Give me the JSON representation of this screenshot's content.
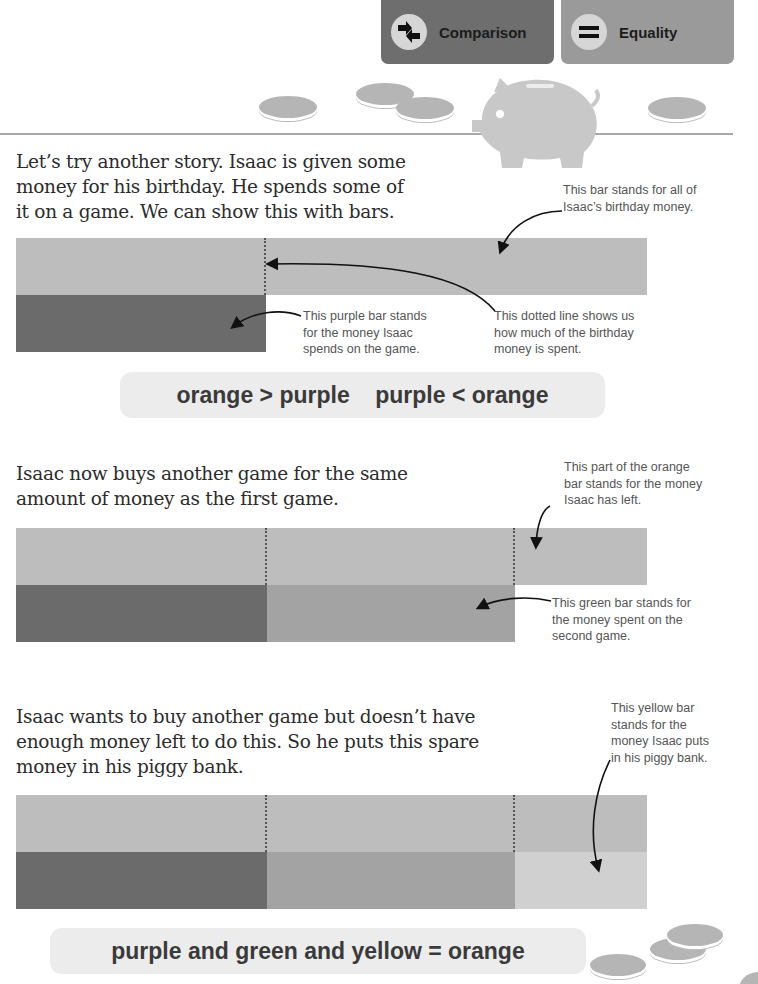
{
  "header": {
    "tabs": [
      {
        "label": "Comparison",
        "icon": "comparison-arrows-icon",
        "color": "#6e6e6e"
      },
      {
        "label": "Equality",
        "icon": "equals-icon",
        "color": "#9a9a9a"
      }
    ]
  },
  "colors": {
    "orange": "#bdbdbd",
    "purple": "#6b6b6b",
    "green": "#a3a3a3",
    "yellow": "#d0d0d0",
    "orange_left": "#b3b3b3",
    "eq_box": "#ececec"
  },
  "section1": {
    "text": "Let’s try another story. Isaac is given some money for his birthday. He spends some of it on a game. We can show this with bars.",
    "lines": [
      "Let’s try another story. Isaac is given some",
      "money for his birthday. He spends some of",
      "it on a game. We can show this with bars."
    ],
    "note_orange": [
      "This bar stands for all of",
      "Isaac’s birthday money."
    ],
    "note_purple": [
      "This purple bar stands",
      "for the money Isaac",
      "spends on the game."
    ],
    "note_dotted": [
      "This dotted line shows us",
      "how much of the birthday",
      "money is spent."
    ],
    "equation": "orange > purple    purple < orange"
  },
  "section2": {
    "lines": [
      "Isaac now buys another game for the same",
      "amount of money as the first game."
    ],
    "note_left": [
      "This part of the orange",
      "bar stands for the money",
      "Isaac has left."
    ],
    "note_green": [
      "This green bar stands for",
      "the money spent on the",
      "second game."
    ]
  },
  "section3": {
    "lines": [
      "Isaac wants to buy another game but doesn’t have",
      "enough money left to do this. So he puts this spare",
      "money in his piggy bank."
    ],
    "note_yellow": [
      "This yellow bar",
      "stands for the",
      "money Isaac puts",
      "in his piggy bank."
    ],
    "equation": "purple and green and yellow = orange"
  }
}
